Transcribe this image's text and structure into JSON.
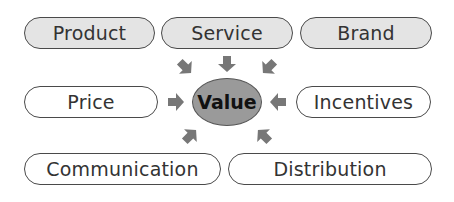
{
  "diagram": {
    "center": {
      "label": "Value",
      "fill": "#9a9a9a"
    },
    "top_row": [
      {
        "label": "Product",
        "style": "filled"
      },
      {
        "label": "Service",
        "style": "filled"
      },
      {
        "label": "Brand",
        "style": "filled"
      }
    ],
    "middle_row": [
      {
        "label": "Price",
        "style": "plain"
      },
      {
        "label": "Incentives",
        "style": "plain"
      }
    ],
    "bottom_row": [
      {
        "label": "Communication",
        "style": "plain"
      },
      {
        "label": "Distribution",
        "style": "plain"
      }
    ],
    "colors": {
      "filled_pill": "#e4e4e4",
      "arrow": "#777777",
      "border": "#4a4a4a"
    }
  }
}
